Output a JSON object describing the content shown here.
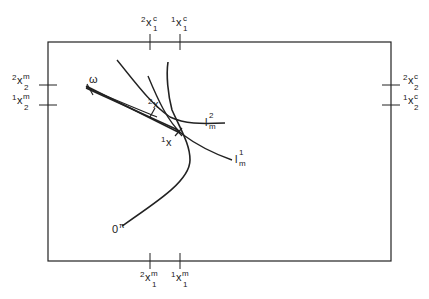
{
  "diagram": {
    "type": "edgeworth-box",
    "box": {
      "x1": 48,
      "y1": 42,
      "x2": 391,
      "y2": 261
    },
    "colors": {
      "line": "#222222",
      "background": "#ffffff"
    },
    "top_ticks": [
      {
        "x": 150,
        "pre": "2",
        "base": "x",
        "sup": "c",
        "sub": "1"
      },
      {
        "x": 180,
        "pre": "1",
        "base": "x",
        "sup": "c",
        "sub": "1"
      }
    ],
    "bottom_ticks": [
      {
        "x": 150,
        "pre": "2",
        "base": "x",
        "sup": "m",
        "sub": "1"
      },
      {
        "x": 180,
        "pre": "1",
        "base": "x",
        "sup": "m",
        "sub": "1"
      }
    ],
    "left_ticks": [
      {
        "y": 85,
        "pre": "2",
        "base": "x",
        "sup": "m",
        "sub": "2"
      },
      {
        "y": 105,
        "pre": "1",
        "base": "x",
        "sup": "m",
        "sub": "2"
      }
    ],
    "right_ticks": [
      {
        "y": 85,
        "pre": "2",
        "base": "x",
        "sup": "c",
        "sub": "2"
      },
      {
        "y": 105,
        "pre": "1",
        "base": "x",
        "sup": "c",
        "sub": "2"
      }
    ],
    "points": {
      "omega": {
        "label": "ω",
        "x": 90,
        "y": 90
      },
      "x2": {
        "pre": "2",
        "base": "x",
        "x": 152,
        "y": 112
      },
      "x1": {
        "pre": "1",
        "base": "x",
        "x": 178,
        "y": 132
      }
    },
    "curves": {
      "lm2": {
        "base": "l",
        "sup": "2",
        "sub": "m"
      },
      "lm1": {
        "base": "l",
        "sup": "1",
        "sub": "m"
      }
    },
    "origin": {
      "base": "0",
      "sup": "π"
    }
  }
}
